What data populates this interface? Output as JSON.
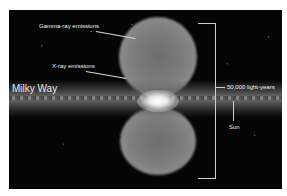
{
  "figure": {
    "colors": {
      "page_background": "#ffffff",
      "image_background": "#050505",
      "label_text": "#f0f0f0",
      "lines": "#cfcfcf"
    },
    "labels": {
      "gamma_ray": "Gamma-ray emissions",
      "x_ray": "X-ray emissions",
      "milky_way": "Milky Way",
      "scale": "50,000 light-years",
      "sun": "Sun"
    }
  }
}
